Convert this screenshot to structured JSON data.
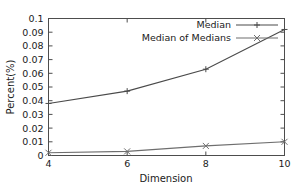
{
  "chart_data": {
    "type": "line",
    "title": "",
    "xlabel": "Dimension",
    "ylabel": "Percent(%)",
    "xlim": [
      4,
      10
    ],
    "ylim": [
      0,
      0.1
    ],
    "grid": false,
    "legend_position": "top-right",
    "x": [
      4,
      6,
      8,
      10
    ],
    "xticks": [
      "4",
      "6",
      "8",
      "10"
    ],
    "yticks": [
      "0",
      "0.01",
      "0.02",
      "0.03",
      "0.04",
      "0.05",
      "0.06",
      "0.07",
      "0.08",
      "0.09",
      "0.1"
    ],
    "ytick_values": [
      0,
      0.01,
      0.02,
      0.03,
      0.04,
      0.05,
      0.06,
      0.07,
      0.08,
      0.09,
      0.1
    ],
    "series": [
      {
        "name": "Median",
        "values": [
          0.038,
          0.047,
          0.063,
          0.092
        ],
        "color": "#4a4a4a",
        "marker": "plus"
      },
      {
        "name": "Median of Medians",
        "values": [
          0.002,
          0.003,
          0.007,
          0.01
        ],
        "color": "#6e6e6e",
        "marker": "cross"
      }
    ]
  },
  "legend": {
    "entries": [
      {
        "label": "Median"
      },
      {
        "label": "Median of Medians"
      }
    ]
  },
  "axes": {
    "x_title": "Dimension",
    "y_title": "Percent(%)",
    "x_tick_labels": [
      "4",
      "6",
      "8",
      "10"
    ],
    "y_tick_labels": [
      "0",
      "0.01",
      "0.02",
      "0.03",
      "0.04",
      "0.05",
      "0.06",
      "0.07",
      "0.08",
      "0.09",
      "0.1"
    ]
  },
  "colors": {
    "background": "#ffffff",
    "axis": "#4d4d4d",
    "series_1": "#4a4a4a",
    "series_2": "#6e6e6e",
    "text": "#1a1a1a"
  }
}
